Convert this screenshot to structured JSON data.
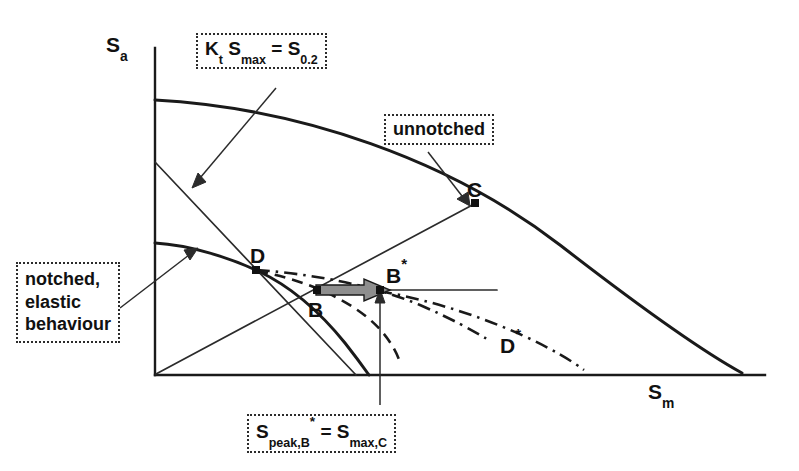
{
  "figure": {
    "type": "haigh-diagram",
    "axes": {
      "y_label_base": "S",
      "y_label_sub": "a",
      "x_label_base": "S",
      "x_label_sub": "m",
      "origin_px": [
        155,
        375
      ],
      "x_axis_end_px": [
        765,
        375
      ],
      "y_axis_top_px": [
        155,
        48
      ]
    },
    "callouts": {
      "kt_relation": {
        "part1": "K",
        "part1_sub": "t",
        "part2": "S",
        "part2_sub": "max",
        "equals": "=",
        "part3": "S",
        "part3_sub": "0.2"
      },
      "unnotched": {
        "label": "unnotched"
      },
      "notched_elastic": {
        "line1": "notched,",
        "line2": "elastic",
        "line3": "behaviour"
      },
      "peak_relation": {
        "part1": "S",
        "part1_sub": "peak,B",
        "part1_sup": "*",
        "equals": "=",
        "part2": "S",
        "part2_sub": "max,C"
      }
    },
    "points": [
      {
        "id": "C",
        "label": "C",
        "sup": "",
        "px": [
          475,
          203
        ],
        "on": "unnotched-curve"
      },
      {
        "id": "D",
        "label": "D",
        "sup": "",
        "px": [
          255,
          270
        ],
        "on": "notched-curve"
      },
      {
        "id": "B",
        "label": "B",
        "sup": "",
        "px": [
          317,
          290
        ],
        "on": "horizontal-transfer-line"
      },
      {
        "id": "Bs",
        "label": "B",
        "sup": "*",
        "px": [
          380,
          290
        ],
        "on": "horizontal-transfer-line"
      },
      {
        "id": "Ds",
        "label": "D",
        "sup": "*",
        "px": [
          500,
          341
        ],
        "on": "dash-dot-curve-end"
      }
    ],
    "curves": [
      {
        "id": "unnotched-curve",
        "style": "solid-thick",
        "note": "upper bound curve from y-axis to x-axis"
      },
      {
        "id": "notched-curve",
        "style": "solid-thick",
        "note": "lower notched elastic curve through D"
      },
      {
        "id": "kt-line",
        "style": "solid-thin",
        "note": "steep descending line Kt Smax = S0.2"
      },
      {
        "id": "diagonal-45",
        "style": "solid-thin",
        "note": "line from origin through B to C"
      },
      {
        "id": "dashed-from-D",
        "style": "dashed",
        "note": "dashed curve descending right from D"
      },
      {
        "id": "dashdot-from-D",
        "style": "dash-dot",
        "note": "dash-dot curve from D to D*"
      },
      {
        "id": "dashdot-lower",
        "style": "dash-dot",
        "note": "lower dash-dot curve from B* region down-right"
      },
      {
        "id": "transfer-arrow",
        "style": "fat-arrow",
        "note": "thick grey arrow from B to B*"
      },
      {
        "id": "vertical-arrow",
        "style": "thin-arrow",
        "note": "vertical arrow from caption box up to B*"
      }
    ],
    "colors": {
      "ink": "#1a1a1a",
      "thin_ink": "#2b2b2b",
      "arrow_fill": "#8e8e8e",
      "background": "#ffffff"
    }
  }
}
